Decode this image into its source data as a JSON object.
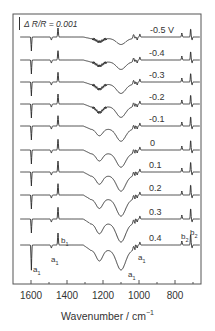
{
  "chart_data": {
    "type": "line",
    "title": "",
    "xlabel": "Wavenumber / cm",
    "xlabel_exponent": "-1",
    "ylabel": "",
    "xlim": [
      1700,
      655
    ],
    "x_reversed": true,
    "x_ticks": [
      1600,
      1400,
      1200,
      1000,
      800
    ],
    "x_minor_ticks": [
      1500,
      1300,
      1100,
      900,
      700
    ],
    "grid": false,
    "scale_bar": {
      "label": "R/R = 0.001",
      "prefix": "Δ"
    },
    "legend": "inline potential labels",
    "series_offset": "vertically stacked spectra",
    "series": [
      {
        "name": "-0.5 V",
        "potential": -0.5
      },
      {
        "name": "-0.4",
        "potential": -0.4
      },
      {
        "name": "-0.3",
        "potential": -0.3
      },
      {
        "name": "-0.2",
        "potential": -0.2
      },
      {
        "name": "-0.1",
        "potential": -0.1
      },
      {
        "name": "0",
        "potential": 0.0
      },
      {
        "name": "0.1",
        "potential": 0.1
      },
      {
        "name": "0.2",
        "potential": 0.2
      },
      {
        "name": "0.3",
        "potential": 0.3
      },
      {
        "name": "0.4",
        "potential": 0.4
      }
    ],
    "bands": [
      {
        "label": "a1",
        "wavenumber": 1598,
        "direction": "down",
        "shape": "sharp"
      },
      {
        "label": "a1",
        "wavenumber": 1487,
        "direction": "down",
        "shape": "small"
      },
      {
        "label": "b1",
        "wavenumber": 1450,
        "direction": "up",
        "shape": "sharp"
      },
      {
        "label": "",
        "wavenumber": 1220,
        "direction": "down",
        "shape": "broad"
      },
      {
        "label": "a1",
        "wavenumber": 1090,
        "direction": "down",
        "shape": "broad"
      },
      {
        "label": "a1",
        "wavenumber": 1010,
        "direction": "down",
        "shape": "small"
      },
      {
        "label": "b2",
        "wavenumber": 760,
        "direction": "up",
        "shape": "small"
      },
      {
        "label": "b2",
        "wavenumber": 713,
        "direction": "up",
        "shape": "sharp"
      }
    ],
    "annotations": [
      {
        "text": "a",
        "sub": "1",
        "near_wavenumber": 1598
      },
      {
        "text": "a",
        "sub": "1",
        "near_wavenumber": 1487
      },
      {
        "text": "b",
        "sub": "1",
        "near_wavenumber": 1450
      },
      {
        "text": "a",
        "sub": "1",
        "near_wavenumber": 1090
      },
      {
        "text": "a",
        "sub": "1",
        "near_wavenumber": 1010
      },
      {
        "text": "b",
        "sub": "2",
        "near_wavenumber": 760
      },
      {
        "text": "b",
        "sub": "2",
        "near_wavenumber": 713
      }
    ]
  },
  "labels": {
    "scale_bar": "R/R = 0.001",
    "scale_delta": "Δ",
    "xlabel": "Wavenumber / cm",
    "xlabel_sup": "−1",
    "ticks": [
      "1600",
      "1400",
      "1200",
      "1000",
      "800"
    ],
    "potentials": [
      "-0.5 V",
      "-0.4",
      "-0.3",
      "-0.2",
      "-0.1",
      "0",
      "0.1",
      "0.2",
      "0.3",
      "0.4"
    ],
    "ann_a": "a",
    "ann_b": "b",
    "sub1": "1",
    "sub2": "2"
  },
  "style": {
    "line_color": "#2a2a2a",
    "frame_color": "#555555"
  }
}
